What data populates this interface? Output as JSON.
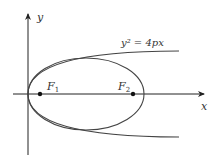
{
  "figure": {
    "type": "conic-sections",
    "axes": {
      "x_label": "x",
      "y_label": "y"
    },
    "curves": [
      {
        "name": "parabola",
        "equation": "y² = 4px"
      },
      {
        "name": "ellipse"
      }
    ],
    "foci": [
      {
        "name": "F1",
        "label_main": "F",
        "label_sub": "1"
      },
      {
        "name": "F2",
        "label_main": "F",
        "label_sub": "2"
      }
    ],
    "colors": {
      "stroke": "#444444",
      "axis": "#222222",
      "label": "#333333"
    }
  }
}
